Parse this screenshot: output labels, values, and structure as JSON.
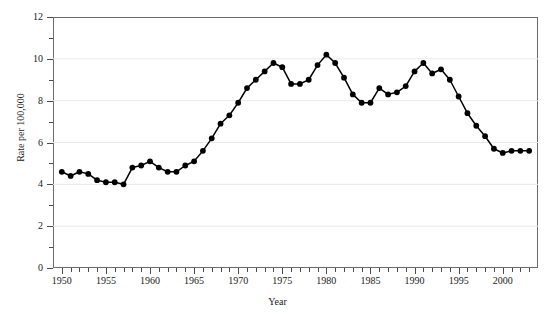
{
  "chart_data": {
    "type": "line",
    "title": "",
    "subtitle": "",
    "xlabel": "Year",
    "ylabel": "Rate per 100,000",
    "xlim": [
      1949,
      2004
    ],
    "ylim": [
      0,
      12
    ],
    "grid": "horizontal",
    "legend": "none",
    "x_ticks_major": [
      1950,
      1955,
      1960,
      1965,
      1970,
      1975,
      1980,
      1985,
      1990,
      1995,
      2000
    ],
    "x_tick_labels": [
      "1950",
      "1955",
      "1960",
      "1965",
      "1970",
      "1975",
      "1980",
      "1985",
      "1990",
      "1995",
      "2000"
    ],
    "x_tick_minor_step": 1,
    "y_ticks_major": [
      0,
      2,
      4,
      6,
      8,
      10,
      12
    ],
    "y_tick_labels": [
      "0",
      "2",
      "4",
      "6",
      "8",
      "10",
      "12"
    ],
    "y_tick_minor": [
      1,
      3,
      5,
      7,
      9,
      11
    ],
    "marker": "filled-circle",
    "marker_color": "#000000",
    "line_color": "#000000",
    "grid_color": "#e9e9e9",
    "frame_color": "#6b6b6b",
    "background": "#ffffff",
    "x": [
      1950,
      1951,
      1952,
      1953,
      1954,
      1955,
      1956,
      1957,
      1958,
      1959,
      1960,
      1961,
      1962,
      1963,
      1964,
      1965,
      1966,
      1967,
      1968,
      1969,
      1970,
      1971,
      1972,
      1973,
      1974,
      1975,
      1976,
      1977,
      1978,
      1979,
      1980,
      1981,
      1982,
      1983,
      1984,
      1985,
      1986,
      1987,
      1988,
      1989,
      1990,
      1991,
      1992,
      1993,
      1994,
      1995,
      1996,
      1997,
      1998,
      1999,
      2000,
      2001,
      2002,
      2003
    ],
    "values": [
      4.6,
      4.4,
      4.6,
      4.5,
      4.2,
      4.1,
      4.1,
      4.0,
      4.8,
      4.9,
      5.1,
      4.8,
      4.6,
      4.6,
      4.9,
      5.1,
      5.6,
      6.2,
      6.9,
      7.3,
      7.9,
      8.6,
      9.0,
      9.4,
      9.8,
      9.6,
      8.8,
      8.8,
      9.0,
      9.7,
      10.2,
      9.8,
      9.1,
      8.3,
      7.9,
      7.9,
      8.6,
      8.3,
      8.4,
      8.7,
      9.4,
      9.8,
      9.3,
      9.5,
      9.0,
      8.2,
      7.4,
      6.8,
      6.3,
      5.7,
      5.5,
      5.6,
      5.6,
      5.6
    ]
  },
  "axis": {
    "x_title": "Year",
    "y_title": "Rate per 100,000"
  }
}
